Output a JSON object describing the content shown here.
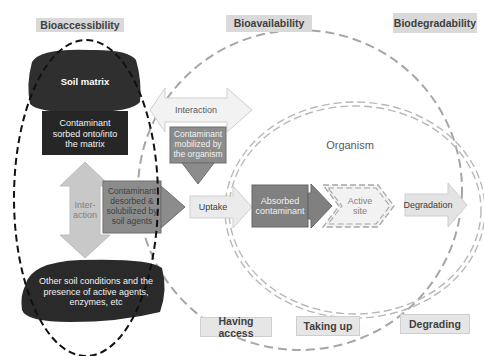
{
  "headers": {
    "bioaccessibility": "Bioaccessibility",
    "bioavailability": "Bioavailability",
    "biodegradability": "Biodegradability"
  },
  "footers": {
    "having_access": "Having access",
    "taking_up": "Taking up",
    "degrading": "Degrading"
  },
  "nodes": {
    "soil_matrix": "Soil matrix",
    "contaminant_sorbed": "Contaminant sorbed onto/into the matrix",
    "interaction_vertical": "Inter-\naction",
    "contaminant_desorbed": "Contaminant desorbed & solubilized by soil agents",
    "other_soil_conditions": "Other soil conditions and the presence of active agents, enzymes, etc",
    "interaction_horizontal": "Interaction",
    "contaminant_mobilized": "Contaminant mobilized by the organism",
    "uptake": "Uptake",
    "organism": "Organism",
    "absorbed_contaminant": "Absorbed contaminant",
    "active_site": "Active site",
    "degradation": "Degradation"
  },
  "colors": {
    "dark_fill": "#2b2b2b",
    "mid_gray": "#7f7f7f",
    "light_arrow": "#d9d9d9",
    "dashed_gray": "#a6a6a6",
    "header_bg": "#d9d9d9"
  }
}
